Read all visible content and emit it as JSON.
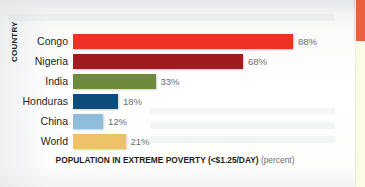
{
  "chart_data": {
    "type": "bar",
    "orientation": "horizontal",
    "title": "",
    "xlabel": "POPULATION IN EXTREME POVERTY (<$1.25/DAY)",
    "xlabel_unit": "(percent)",
    "ylabel": "COUNTRY",
    "categories": [
      "Congo",
      "Nigeria",
      "India",
      "Honduras",
      "China",
      "World"
    ],
    "values": [
      88,
      68,
      33,
      18,
      12,
      21
    ],
    "value_labels": [
      "88%",
      "68%",
      "33%",
      "18%",
      "12%",
      "21%"
    ],
    "xlim": [
      0,
      100
    ],
    "grid": false,
    "legend": false,
    "bar_colors": [
      "#ee3124",
      "#9e1b1e",
      "#6e8b3d",
      "#0d4d7c",
      "#8fbddb",
      "#edc268"
    ]
  },
  "page": {
    "edge_tab_color": "#e8603c",
    "edge_strip_color": "#fbfbe6"
  }
}
